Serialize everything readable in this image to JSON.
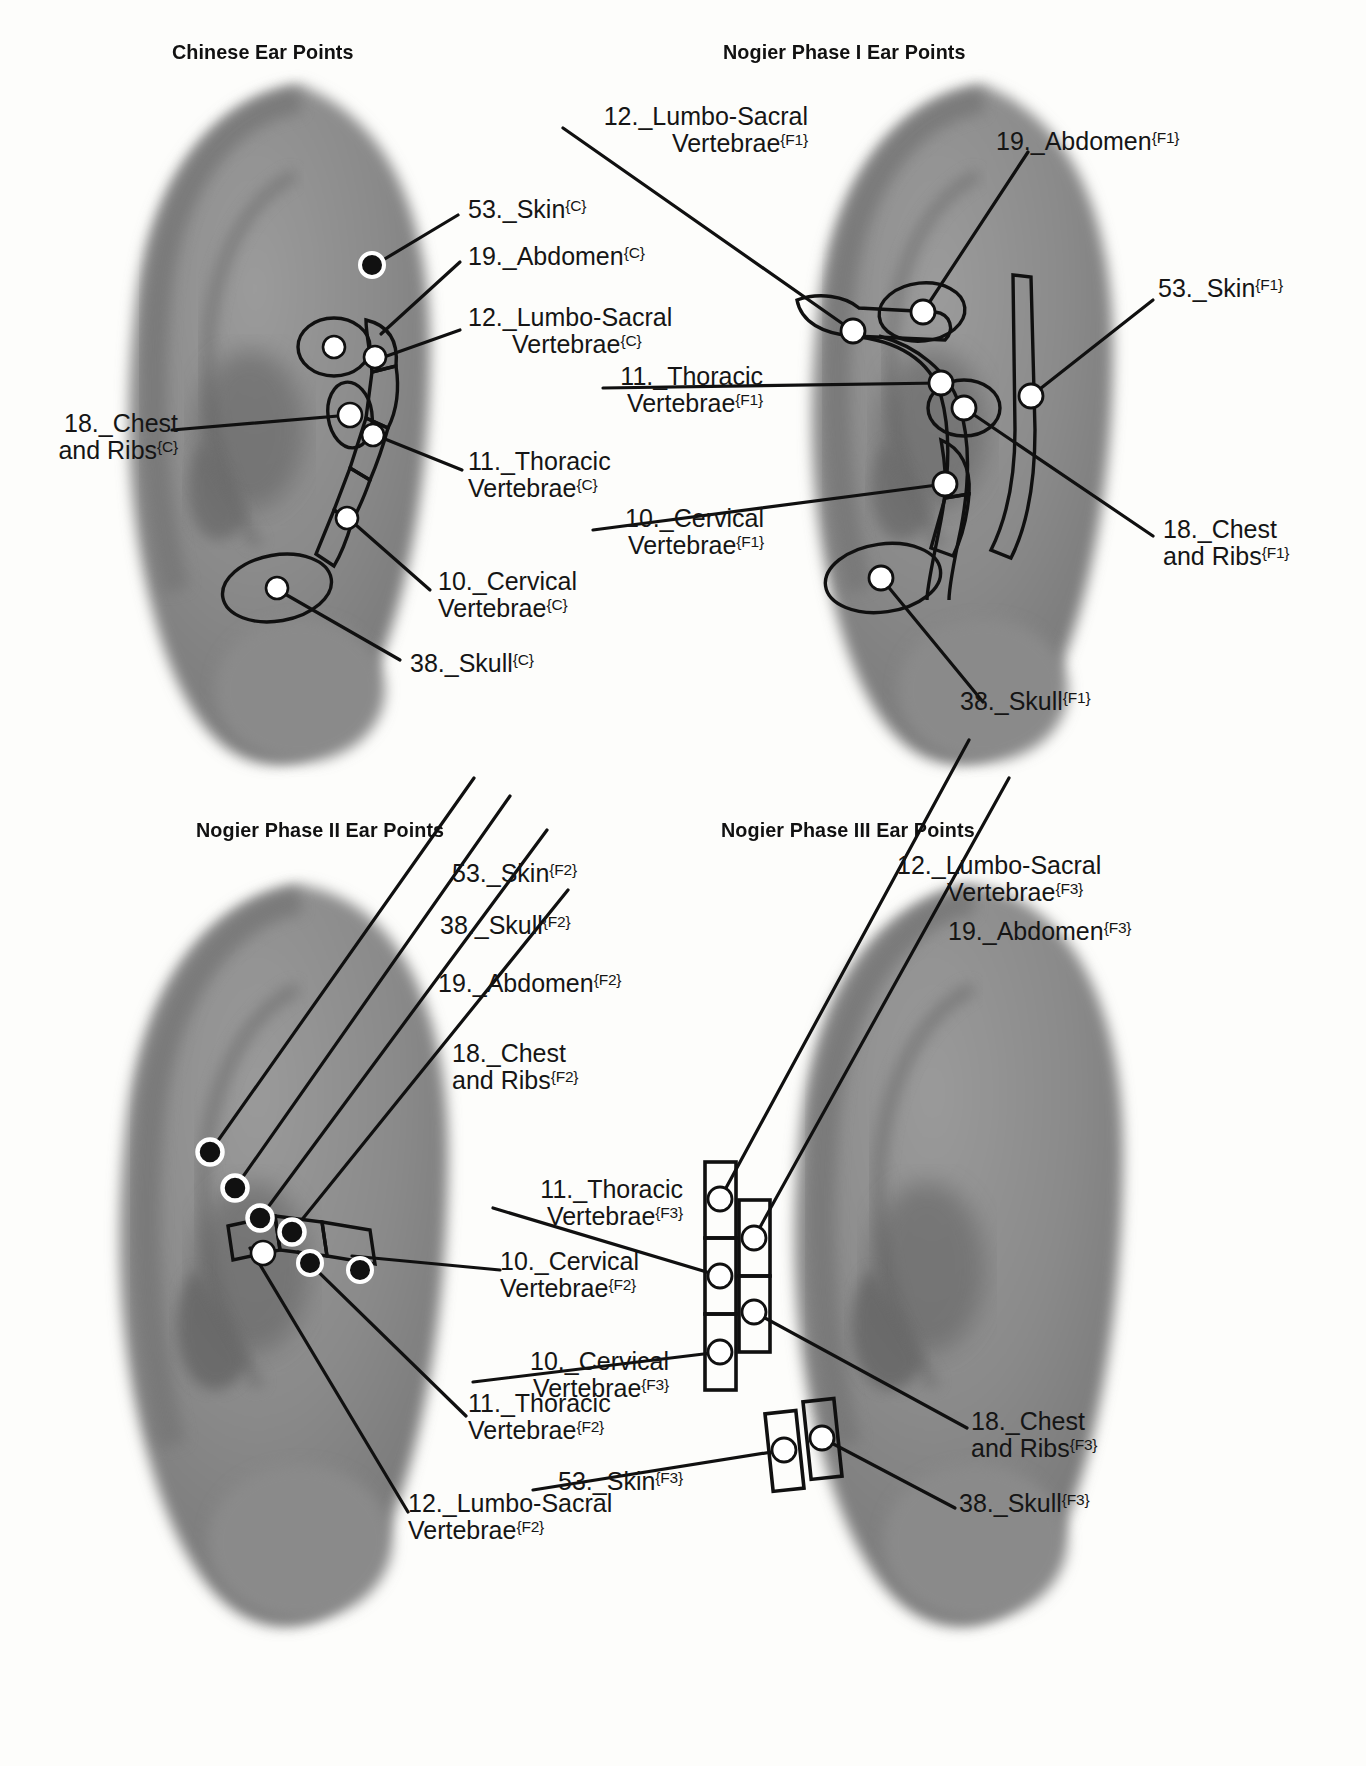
{
  "panels": [
    {
      "id": "chinese",
      "title": "Chinese Ear Points",
      "labels": [
        {
          "key": "skin",
          "line1": "53._Skin",
          "sup1": "{C}",
          "line2": "",
          "sup2": ""
        },
        {
          "key": "abdomen",
          "line1": "19._Abdomen",
          "sup1": "{C}",
          "line2": "",
          "sup2": ""
        },
        {
          "key": "lumbo",
          "line1": "12._Lumbo-Sacral",
          "sup1": "",
          "line2": "Vertebrae",
          "sup2": "{C}"
        },
        {
          "key": "thoracic",
          "line1": "11._Thoracic",
          "sup1": "",
          "line2": "Vertebrae",
          "sup2": "{C}"
        },
        {
          "key": "cervical",
          "line1": "10._Cervical",
          "sup1": "",
          "line2": "Vertebrae",
          "sup2": "{C}"
        },
        {
          "key": "skull",
          "line1": "38._Skull",
          "sup1": "{C}",
          "line2": "",
          "sup2": ""
        },
        {
          "key": "chest",
          "line1": "18._Chest",
          "sup1": "",
          "line2": "and Ribs",
          "sup2": "{C}"
        }
      ]
    },
    {
      "id": "phase1",
      "title": "Nogier Phase I Ear Points",
      "labels": [
        {
          "key": "lumbo",
          "line1": "12._Lumbo-Sacral",
          "sup1": "",
          "line2": "Vertebrae",
          "sup2": "{F1}"
        },
        {
          "key": "abdomen",
          "line1": "19._Abdomen",
          "sup1": "{F1}",
          "line2": "",
          "sup2": ""
        },
        {
          "key": "skin",
          "line1": "53._Skin",
          "sup1": "{F1}",
          "line2": "",
          "sup2": ""
        },
        {
          "key": "thoracic",
          "line1": "11._Thoracic",
          "sup1": "",
          "line2": "Vertebrae",
          "sup2": "{F1}"
        },
        {
          "key": "cervical",
          "line1": "10._Cervical",
          "sup1": "",
          "line2": "Vertebrae",
          "sup2": "{F1}"
        },
        {
          "key": "chest",
          "line1": "18._Chest",
          "sup1": "",
          "line2": "and Ribs",
          "sup2": "{F1}"
        },
        {
          "key": "skull",
          "line1": "38._Skull",
          "sup1": "{F1}",
          "line2": "",
          "sup2": ""
        }
      ]
    },
    {
      "id": "phase2",
      "title": "Nogier Phase II Ear Points",
      "labels": [
        {
          "key": "skin",
          "line1": "53._Skin",
          "sup1": "{F2}",
          "line2": "",
          "sup2": ""
        },
        {
          "key": "skull",
          "line1": "38._Skull",
          "sup1": "{F2}",
          "line2": "",
          "sup2": ""
        },
        {
          "key": "abdomen",
          "line1": "19._Abdomen",
          "sup1": "{F2}",
          "line2": "",
          "sup2": ""
        },
        {
          "key": "chest",
          "line1": "18._Chest",
          "sup1": "",
          "line2": "and Ribs",
          "sup2": "{F2}"
        },
        {
          "key": "cervical",
          "line1": "10._Cervical",
          "sup1": "",
          "line2": "Vertebrae",
          "sup2": "{F2}"
        },
        {
          "key": "thoracic",
          "line1": "11._Thoracic",
          "sup1": "",
          "line2": "Vertebrae",
          "sup2": "{F2}"
        },
        {
          "key": "lumbo",
          "line1": "12._Lumbo-Sacral",
          "sup1": "",
          "line2": "Vertebrae",
          "sup2": "{F2}"
        }
      ]
    },
    {
      "id": "phase3",
      "title": "Nogier Phase III Ear Points",
      "labels": [
        {
          "key": "lumbo",
          "line1": "12._Lumbo-Sacral",
          "sup1": "",
          "line2": "Vertebrae",
          "sup2": "{F3}"
        },
        {
          "key": "abdomen",
          "line1": "19._Abdomen",
          "sup1": "{F3}",
          "line2": "",
          "sup2": ""
        },
        {
          "key": "thoracic",
          "line1": "11._Thoracic",
          "sup1": "",
          "line2": "Vertebrae",
          "sup2": "{F3}"
        },
        {
          "key": "cervical",
          "line1": "10._Cervical",
          "sup1": "",
          "line2": "Vertebrae",
          "sup2": "{F3}"
        },
        {
          "key": "chest",
          "line1": "18._Chest",
          "sup1": "",
          "line2": "and Ribs",
          "sup2": "{F3}"
        },
        {
          "key": "skull",
          "line1": "38._Skull",
          "sup1": "{F3}",
          "line2": "",
          "sup2": ""
        },
        {
          "key": "skin",
          "line1": "53._Skin",
          "sup1": "{F3}",
          "line2": "",
          "sup2": ""
        }
      ]
    }
  ],
  "colors": {
    "ear_fill": "#8c8c8c",
    "ear_shadow": "#6e6e6e",
    "line": "#101010",
    "marker_open": "#ffffff",
    "marker_filled": "#111111",
    "text": "#151515",
    "background": "#fdfdfb"
  }
}
